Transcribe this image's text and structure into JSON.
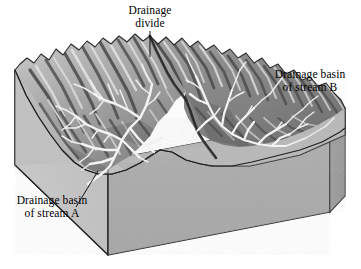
{
  "figure": {
    "type": "block-diagram",
    "background_color": "#ffffff",
    "line_color": "#000000"
  },
  "labels": {
    "drainage_divide": {
      "line1": "Drainage",
      "line2": "divide",
      "leader": "vertical-line-down"
    },
    "basin_b": {
      "line1": "Drainage basin",
      "line2": "of stream B",
      "leader": "none"
    },
    "basin_a": {
      "line1": "Drainage basin",
      "line2": "of stream A",
      "leader": "diagonal-line-up-right"
    }
  },
  "block": {
    "front_face_color": "#a9a9a9",
    "right_face_color": "#9a9a9a",
    "left_face_color": "#c2c2c2",
    "plain_color": "#b4b4b4",
    "outline_color": "#1a1a1a"
  },
  "terrain": {
    "highland_light": "#e8e8e8",
    "highland_mid": "#8e8e8e",
    "highland_dark": "#454545",
    "stream_color": "#f2f2f2",
    "divide_ridge_color": "#2b2b2b"
  },
  "features": [
    {
      "name": "drainage-divide-ridge",
      "description": "dark ridge crest separating basin A and basin B"
    },
    {
      "name": "stream-network-a",
      "description": "dendritic stream network draining to lower left"
    },
    {
      "name": "stream-network-b",
      "description": "dendritic stream network draining to lower right"
    },
    {
      "name": "lowland-plain",
      "description": "flat gray plain in front of the mountains"
    }
  ]
}
